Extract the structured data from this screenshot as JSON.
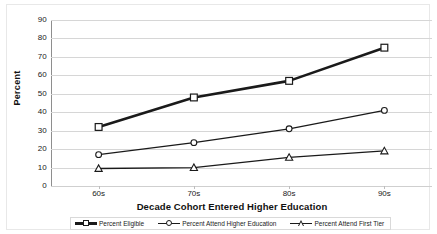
{
  "chart_data": {
    "type": "line",
    "title": "",
    "xlabel": "Decade Cohort Entered Higher Education",
    "ylabel": "Percent",
    "categories": [
      "60s",
      "70s",
      "80s",
      "90s"
    ],
    "ylim": [
      0,
      90
    ],
    "ytick_step": 10,
    "yticks": [
      "90",
      "80",
      "70",
      "60",
      "50",
      "40",
      "30",
      "20",
      "10",
      "0"
    ],
    "grid": true,
    "legend_position": "bottom",
    "series": [
      {
        "name": "Percent Eligible",
        "marker": "square",
        "line_weight": "thick",
        "color": "#1a1a1a",
        "values": [
          32,
          48,
          57,
          75
        ]
      },
      {
        "name": "Percent Attend Higher Education",
        "marker": "circle",
        "line_weight": "thin",
        "color": "#1a1a1a",
        "values": [
          17,
          23.5,
          31,
          41
        ]
      },
      {
        "name": "Percent Attend First Tier",
        "marker": "triangle",
        "line_weight": "thin",
        "color": "#1a1a1a",
        "values": [
          9.5,
          10,
          15.5,
          19
        ]
      }
    ]
  },
  "axes": {
    "y_title": "Percent",
    "x_title": "Decade Cohort Entered Higher Education"
  },
  "legend": {
    "entries": [
      {
        "label": "Percent Eligible"
      },
      {
        "label": "Percent Attend Higher Education"
      },
      {
        "label": "Percent Attend First Tier"
      }
    ]
  }
}
